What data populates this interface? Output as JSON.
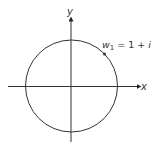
{
  "diagram": {
    "type": "complex-plane-circle",
    "axes": {
      "x_label": "x",
      "y_label": "y"
    },
    "point": {
      "name": "w",
      "subscript": "1",
      "equals": "=",
      "value_real": "1",
      "plus": "+",
      "value_imag": "i"
    },
    "colors": {
      "stroke": "#333333",
      "background": "#ffffff"
    }
  }
}
